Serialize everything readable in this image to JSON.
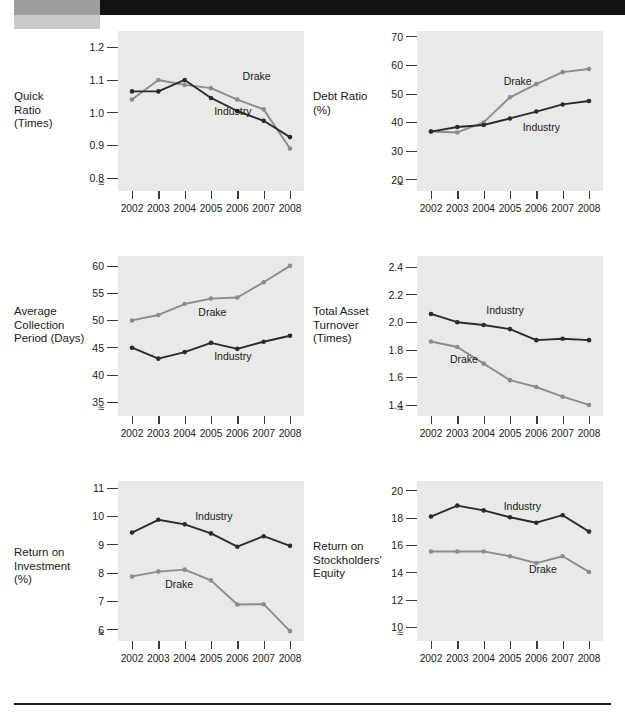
{
  "page": {
    "header_bar_color": "#111111",
    "header_block_color": "#9e9e9e",
    "footer_rule_color": "#1a1a1a",
    "panel_color": "#e9e9e9",
    "series_colors": {
      "industry": "#2b2b2b",
      "drake": "#8c8c8c"
    },
    "axis_break_symbol": "≈"
  },
  "years": [
    "2002",
    "2003",
    "2004",
    "2005",
    "2006",
    "2007",
    "2008"
  ],
  "series_names": {
    "drake": "Drake",
    "industry": "Industry"
  },
  "charts": [
    {
      "id": "quick-ratio",
      "label_lines": [
        "Quick",
        "Ratio",
        "(Times)"
      ],
      "label_text": "Quick Ratio (Times)",
      "yticks": [
        "1.2",
        "1.1",
        "1.0",
        "0.9",
        "0.8"
      ],
      "ytick_values": [
        1.2,
        1.1,
        1.0,
        0.9,
        0.8
      ],
      "ylim": [
        0.76,
        1.25
      ],
      "drake_label_pos": {
        "x": 0.7,
        "y": 1.112
      },
      "industry_label_pos": {
        "x": 0.52,
        "y": 1.005
      }
    },
    {
      "id": "debt-ratio",
      "label_lines": [
        "Debt Ratio",
        "(%)"
      ],
      "label_text": "Debt Ratio (%)",
      "yticks": [
        "70",
        "60",
        "50",
        "40",
        "30",
        "20"
      ],
      "ytick_values": [
        70,
        60,
        50,
        40,
        30,
        20
      ],
      "ylim": [
        16,
        72
      ],
      "drake_label_pos": {
        "x": 0.46,
        "y": 54.5
      },
      "industry_label_pos": {
        "x": 0.58,
        "y": 38.5
      }
    },
    {
      "id": "average-collection-period",
      "label_lines": [
        "Average",
        "Collection",
        "Period (Days)"
      ],
      "label_text": "Average Collection Period (Days)",
      "yticks": [
        "60",
        "55",
        "50",
        "45",
        "40",
        "35"
      ],
      "ytick_values": [
        60,
        55,
        50,
        45,
        40,
        35
      ],
      "ylim": [
        32.5,
        61.8
      ],
      "drake_label_pos": {
        "x": 0.42,
        "y": 51.6
      },
      "industry_label_pos": {
        "x": 0.52,
        "y": 43.4
      }
    },
    {
      "id": "total-asset-turnover",
      "label_lines": [
        "Total Asset",
        "Turnover",
        "(Times)"
      ],
      "label_text": "Total Asset Turnover (Times)",
      "yticks": [
        "2.4",
        "2.2",
        "2.0",
        "1.8",
        "1.6",
        "1.4"
      ],
      "ytick_values": [
        2.4,
        2.2,
        2.0,
        1.8,
        1.6,
        1.4
      ],
      "ylim": [
        1.32,
        2.48
      ],
      "drake_label_pos": {
        "x": 0.12,
        "y": 1.735
      },
      "industry_label_pos": {
        "x": 0.35,
        "y": 2.085
      }
    },
    {
      "id": "return-on-investment",
      "label_lines": [
        "Return on",
        "Investment",
        "(%)"
      ],
      "label_text": "Return on Investment (%)",
      "yticks": [
        "11",
        "10",
        "9",
        "8",
        "7",
        "6"
      ],
      "ytick_values": [
        11,
        10,
        9,
        8,
        7,
        6
      ],
      "ylim": [
        5.6,
        11.25
      ],
      "drake_label_pos": {
        "x": 0.21,
        "y": 7.62
      },
      "industry_label_pos": {
        "x": 0.4,
        "y": 10.02
      }
    },
    {
      "id": "return-on-stockholders-equity",
      "label_lines": [
        "Return on",
        "Stockholders'",
        "Equity"
      ],
      "label_text": "Return on Stockholders' Equity",
      "yticks": [
        "20",
        "18",
        "16",
        "14",
        "12",
        "10"
      ],
      "ytick_values": [
        20,
        18,
        16,
        14,
        12,
        10
      ],
      "ylim": [
        9.0,
        20.7
      ],
      "drake_label_pos": {
        "x": 0.62,
        "y": 14.3
      },
      "industry_label_pos": {
        "x": 0.46,
        "y": 18.9
      }
    }
  ],
  "chart_data": [
    {
      "type": "line",
      "title": "Quick Ratio (Times)",
      "xlabel": "",
      "ylabel": "Quick Ratio (Times)",
      "x": [
        "2002",
        "2003",
        "2004",
        "2005",
        "2006",
        "2007",
        "2008"
      ],
      "ylim": [
        0.76,
        1.25
      ],
      "yticks": [
        0.8,
        0.9,
        1.0,
        1.1,
        1.2
      ],
      "grid": false,
      "legend": "inline-annotation",
      "series": [
        {
          "name": "Drake",
          "color": "#8c8c8c",
          "values": [
            1.04,
            1.1,
            1.085,
            1.075,
            1.04,
            1.01,
            0.89
          ]
        },
        {
          "name": "Industry",
          "color": "#2b2b2b",
          "values": [
            1.065,
            1.065,
            1.1,
            1.045,
            1.005,
            0.975,
            0.925
          ]
        }
      ]
    },
    {
      "type": "line",
      "title": "Debt Ratio (%)",
      "xlabel": "",
      "ylabel": "Debt Ratio (%)",
      "x": [
        "2002",
        "2003",
        "2004",
        "2005",
        "2006",
        "2007",
        "2008"
      ],
      "ylim": [
        16,
        72
      ],
      "yticks": [
        20,
        30,
        40,
        50,
        60,
        70
      ],
      "grid": false,
      "legend": "inline-annotation",
      "series": [
        {
          "name": "Drake",
          "color": "#8c8c8c",
          "values": [
            36.8,
            36.5,
            40.0,
            48.8,
            53.4,
            57.6,
            58.7
          ]
        },
        {
          "name": "Industry",
          "color": "#2b2b2b",
          "values": [
            36.8,
            38.4,
            39.1,
            41.4,
            43.8,
            46.3,
            47.5
          ]
        }
      ]
    },
    {
      "type": "line",
      "title": "Average Collection Period (Days)",
      "xlabel": "",
      "ylabel": "Average Collection Period (Days)",
      "x": [
        "2002",
        "2003",
        "2004",
        "2005",
        "2006",
        "2007",
        "2008"
      ],
      "ylim": [
        32.5,
        61.8
      ],
      "yticks": [
        35,
        40,
        45,
        50,
        55,
        60
      ],
      "grid": false,
      "legend": "inline-annotation",
      "series": [
        {
          "name": "Drake",
          "color": "#8c8c8c",
          "values": [
            50.0,
            51.0,
            53.0,
            54.0,
            54.2,
            57.0,
            60.0
          ]
        },
        {
          "name": "Industry",
          "color": "#2b2b2b",
          "values": [
            45.0,
            43.0,
            44.2,
            45.9,
            44.8,
            46.1,
            47.2
          ]
        }
      ]
    },
    {
      "type": "line",
      "title": "Total Asset Turnover (Times)",
      "xlabel": "",
      "ylabel": "Total Asset Turnover (Times)",
      "x": [
        "2002",
        "2003",
        "2004",
        "2005",
        "2006",
        "2007",
        "2008"
      ],
      "ylim": [
        1.32,
        2.48
      ],
      "yticks": [
        1.4,
        1.6,
        1.8,
        2.0,
        2.2,
        2.4
      ],
      "grid": false,
      "legend": "inline-annotation",
      "series": [
        {
          "name": "Drake",
          "color": "#8c8c8c",
          "values": [
            1.86,
            1.82,
            1.7,
            1.58,
            1.53,
            1.46,
            1.4
          ]
        },
        {
          "name": "Industry",
          "color": "#2b2b2b",
          "values": [
            2.06,
            2.0,
            1.98,
            1.95,
            1.87,
            1.88,
            1.87
          ]
        }
      ]
    },
    {
      "type": "line",
      "title": "Return on Investment (%)",
      "xlabel": "",
      "ylabel": "Return on Investment (%)",
      "x": [
        "2002",
        "2003",
        "2004",
        "2005",
        "2006",
        "2007",
        "2008"
      ],
      "ylim": [
        5.6,
        11.25
      ],
      "yticks": [
        6,
        7,
        8,
        9,
        10,
        11
      ],
      "grid": false,
      "legend": "inline-annotation",
      "series": [
        {
          "name": "Drake",
          "color": "#8c8c8c",
          "values": [
            7.88,
            8.05,
            8.12,
            7.74,
            6.89,
            6.9,
            5.95
          ]
        },
        {
          "name": "Industry",
          "color": "#2b2b2b",
          "values": [
            9.43,
            9.88,
            9.72,
            9.4,
            8.93,
            9.3,
            8.96
          ]
        }
      ]
    },
    {
      "type": "line",
      "title": "Return on Stockholders' Equity",
      "xlabel": "",
      "ylabel": "Return on Stockholders' Equity",
      "x": [
        "2002",
        "2003",
        "2004",
        "2005",
        "2006",
        "2007",
        "2008"
      ],
      "ylim": [
        9.0,
        20.7
      ],
      "yticks": [
        10,
        12,
        14,
        16,
        18,
        20
      ],
      "grid": false,
      "legend": "inline-annotation",
      "series": [
        {
          "name": "Drake",
          "color": "#8c8c8c",
          "values": [
            15.55,
            15.55,
            15.55,
            15.2,
            14.7,
            15.2,
            14.05
          ]
        },
        {
          "name": "Industry",
          "color": "#2b2b2b",
          "values": [
            18.1,
            18.9,
            18.55,
            18.05,
            17.65,
            18.2,
            17.0
          ]
        }
      ]
    }
  ]
}
